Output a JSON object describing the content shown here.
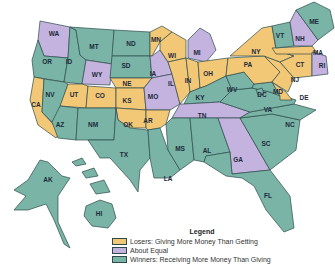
{
  "colors": {
    "losers": "#f2c776",
    "equal": "#c3b3de",
    "winners": "#79b4a6",
    "border": "#2e4a4a",
    "label": "#1e2a3a"
  },
  "legend": {
    "title": "Legend",
    "items": [
      {
        "category": "losers",
        "label": "Losers: Giving More Money Than Getting"
      },
      {
        "category": "equal",
        "label": "About Equal"
      },
      {
        "category": "winners",
        "label": "Winners: Receiving More Money Than Giving"
      }
    ]
  },
  "states": [
    {
      "abbr": "WA",
      "category": "equal"
    },
    {
      "abbr": "OR",
      "category": "winners"
    },
    {
      "abbr": "CA",
      "category": "losers"
    },
    {
      "abbr": "ID",
      "category": "winners"
    },
    {
      "abbr": "NV",
      "category": "winners"
    },
    {
      "abbr": "MT",
      "category": "winners"
    },
    {
      "abbr": "WY",
      "category": "equal"
    },
    {
      "abbr": "UT",
      "category": "losers"
    },
    {
      "abbr": "AZ",
      "category": "winners"
    },
    {
      "abbr": "CO",
      "category": "losers"
    },
    {
      "abbr": "NM",
      "category": "winners"
    },
    {
      "abbr": "ND",
      "category": "winners"
    },
    {
      "abbr": "SD",
      "category": "winners"
    },
    {
      "abbr": "NE",
      "category": "losers"
    },
    {
      "abbr": "KS",
      "category": "losers"
    },
    {
      "abbr": "OK",
      "category": "losers"
    },
    {
      "abbr": "TX",
      "category": "winners"
    },
    {
      "abbr": "MN",
      "category": "losers"
    },
    {
      "abbr": "IA",
      "category": "equal"
    },
    {
      "abbr": "MO",
      "category": "equal"
    },
    {
      "abbr": "AR",
      "category": "losers"
    },
    {
      "abbr": "LA",
      "category": "winners"
    },
    {
      "abbr": "WI",
      "category": "losers"
    },
    {
      "abbr": "IL",
      "category": "losers"
    },
    {
      "abbr": "MI",
      "category": "equal"
    },
    {
      "abbr": "IN",
      "category": "losers"
    },
    {
      "abbr": "OH",
      "category": "losers"
    },
    {
      "abbr": "KY",
      "category": "winners"
    },
    {
      "abbr": "TN",
      "category": "equal"
    },
    {
      "abbr": "MS",
      "category": "winners"
    },
    {
      "abbr": "AL",
      "category": "winners"
    },
    {
      "abbr": "GA",
      "category": "equal"
    },
    {
      "abbr": "FL",
      "category": "winners"
    },
    {
      "abbr": "SC",
      "category": "winners"
    },
    {
      "abbr": "NC",
      "category": "winners"
    },
    {
      "abbr": "VA",
      "category": "winners"
    },
    {
      "abbr": "WV",
      "category": "winners"
    },
    {
      "abbr": "MD",
      "category": "winners"
    },
    {
      "abbr": "DC",
      "category": "winners"
    },
    {
      "abbr": "DE",
      "category": "losers"
    },
    {
      "abbr": "PA",
      "category": "losers"
    },
    {
      "abbr": "NJ",
      "category": "losers"
    },
    {
      "abbr": "NY",
      "category": "losers"
    },
    {
      "abbr": "CT",
      "category": "losers"
    },
    {
      "abbr": "RI",
      "category": "equal"
    },
    {
      "abbr": "MA",
      "category": "losers"
    },
    {
      "abbr": "VT",
      "category": "winners"
    },
    {
      "abbr": "NH",
      "category": "equal"
    },
    {
      "abbr": "ME",
      "category": "winners"
    },
    {
      "abbr": "AK",
      "category": "winners"
    },
    {
      "abbr": "HI",
      "category": "winners"
    }
  ]
}
